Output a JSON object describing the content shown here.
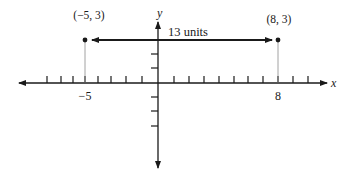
{
  "diagram": {
    "type": "coordinate-plane-distance",
    "axes": {
      "x_label": "x",
      "y_label": "y"
    },
    "x_tick_labels": [
      {
        "value": -5,
        "text": "−5"
      },
      {
        "value": 8,
        "text": "8"
      }
    ],
    "points": [
      {
        "name": "A",
        "x": -5,
        "y": 3,
        "label": "(−5, 3)"
      },
      {
        "name": "B",
        "x": 8,
        "y": 3,
        "label": "(8, 3)"
      }
    ],
    "distance_label": "13 units",
    "colors": {
      "line": "#1a1a1a",
      "guide": "#8a8a8a",
      "background": "#ffffff"
    }
  }
}
